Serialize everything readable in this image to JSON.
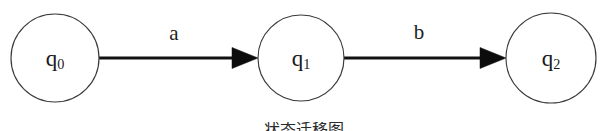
{
  "diagram": {
    "type": "finite-state-machine",
    "background_color": "#ffffff",
    "stroke_color": "#3a3a3a",
    "edge_color": "#111111",
    "text_color": "#1b1b1b",
    "states": [
      {
        "id": "q0",
        "label_base": "q",
        "label_sub": "0",
        "cx": 55,
        "cy": 58,
        "r": 44
      },
      {
        "id": "q1",
        "label_base": "q",
        "label_sub": "1",
        "cx": 301,
        "cy": 58,
        "r": 43
      },
      {
        "id": "q2",
        "label_base": "q",
        "label_sub": "2",
        "cx": 551,
        "cy": 58,
        "r": 45
      }
    ],
    "transitions": [
      {
        "id": "t0",
        "from": "q0",
        "to": "q1",
        "symbol": "a",
        "x1": 99,
        "x2": 258,
        "y": 58,
        "label_x": 174,
        "label_y": 33
      },
      {
        "id": "t1",
        "from": "q1",
        "to": "q2",
        "symbol": "b",
        "x1": 344,
        "x2": 506,
        "y": 58,
        "label_x": 419,
        "label_y": 32
      }
    ],
    "caption": {
      "text": "状态迁移图",
      "y": 122,
      "clipped": true
    }
  }
}
